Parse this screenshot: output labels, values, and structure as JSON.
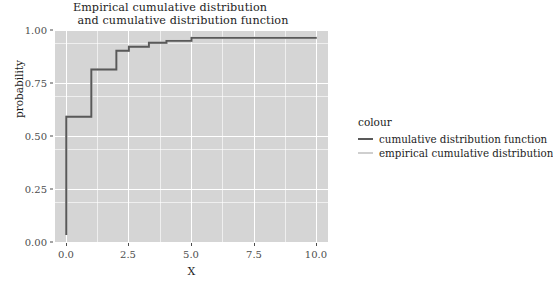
{
  "chart_data": {
    "type": "line",
    "title": "Empirical cumulative distribution\nand cumulative distribution function",
    "title_lines": [
      "Empirical cumulative distribution",
      "and cumulative distribution function"
    ],
    "xlabel": "X",
    "ylabel": "probability",
    "xlim": [
      -0.45,
      10.45
    ],
    "ylim": [
      -0.04,
      1.04
    ],
    "xticks": [
      0.0,
      2.5,
      5.0,
      7.5,
      10.0
    ],
    "xtick_labels": [
      "0.0",
      "2.5",
      "5.0",
      "7.5",
      "10.0"
    ],
    "yticks": [
      0.0,
      0.25,
      0.5,
      0.75,
      1.0
    ],
    "ytick_labels": [
      "0.00",
      "0.25",
      "0.50",
      "0.75",
      "1.00"
    ],
    "x_minor_ticks": [
      1.25,
      3.75,
      6.25,
      8.75
    ],
    "y_minor_ticks": [
      0.125,
      0.375,
      0.625,
      0.875
    ],
    "grid": true,
    "legend_position": "right",
    "legend_title": "colour",
    "panel_background": "#d5d5d5",
    "grid_color": "#ffffff",
    "series": [
      {
        "name": "cumulative distribution function",
        "color": "#595959",
        "type": "step",
        "x": [
          0,
          0,
          1,
          1,
          2,
          2,
          2.5,
          2.5,
          3.3,
          3.3,
          4.0,
          4.0,
          5.0,
          5.0,
          10.0
        ],
        "y": [
          0.0,
          0.6,
          0.6,
          0.84,
          0.84,
          0.935,
          0.935,
          0.955,
          0.955,
          0.975,
          0.975,
          0.985,
          0.985,
          1.0,
          1.0
        ]
      },
      {
        "name": "empirical cumulative distribution",
        "color": "#cfcfcf",
        "type": "step",
        "x": [
          0,
          0,
          1,
          1,
          2,
          2,
          2.5,
          2.5,
          3.3,
          3.3,
          4.0,
          4.0,
          5.0,
          5.0,
          10.0
        ],
        "y": [
          0.0,
          0.6,
          0.6,
          0.84,
          0.84,
          0.935,
          0.935,
          0.955,
          0.955,
          0.975,
          0.975,
          0.985,
          0.985,
          1.0,
          1.0
        ]
      }
    ],
    "legend_entries": [
      {
        "label": "cumulative distribution function",
        "color": "#595959"
      },
      {
        "label": "empirical cumulative distribution",
        "color": "#cfcfcf"
      }
    ]
  }
}
